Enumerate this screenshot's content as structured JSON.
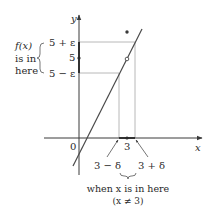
{
  "figure": {
    "type": "epsilon-delta limit illustration",
    "axes": {
      "x_label": "x",
      "y_label": "y",
      "origin_label": "0"
    },
    "y_ticks": {
      "upper": "5 + ε",
      "center": "5",
      "lower": "5 − ε"
    },
    "x_ticks": {
      "center": "3",
      "left": "3 − δ",
      "right": "3 + δ"
    },
    "left_annotation": {
      "line1": "f(x)",
      "line2": "is in",
      "line3": "here"
    },
    "bottom_annotation": {
      "line1": "when x is in here",
      "line2": "(x ≠ 3)"
    },
    "points": {
      "filled_point": "isolated value f(3) above the line",
      "hollow_point": "removed point at (3, 5)"
    },
    "colors": {
      "axis": "#3a3a3a",
      "guide_lines": "#b8b8b8",
      "curve": "#4a4a4a",
      "text": "#2a2a2a"
    }
  }
}
